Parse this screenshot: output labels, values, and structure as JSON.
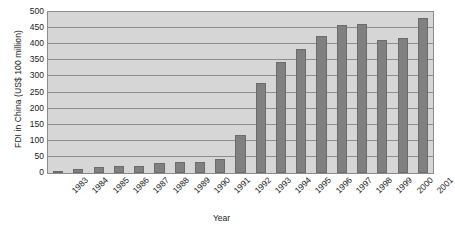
{
  "chart_data": {
    "type": "bar",
    "title": "",
    "xlabel": "Year",
    "ylabel": "FDI in China (US$ 100 million)",
    "categories": [
      "1983",
      "1984",
      "1985",
      "1986",
      "1987",
      "1988",
      "1989",
      "1990",
      "1991",
      "1992",
      "1993",
      "1994",
      "1995",
      "1996",
      "1997",
      "1998",
      "1999",
      "2000",
      "2001"
    ],
    "values": [
      6,
      13,
      19,
      22,
      23,
      32,
      33,
      35,
      44,
      117,
      280,
      345,
      385,
      425,
      460,
      462,
      414,
      419,
      482
    ],
    "series": [
      {
        "name": "FDI in China",
        "values": [
          6,
          13,
          19,
          22,
          23,
          32,
          33,
          35,
          44,
          117,
          280,
          345,
          385,
          425,
          460,
          462,
          414,
          419,
          482
        ]
      }
    ],
    "ylim": [
      0,
      500
    ],
    "y_ticks": [
      0,
      50,
      100,
      150,
      200,
      250,
      300,
      350,
      400,
      450,
      500
    ],
    "y_tick_labels": [
      "0",
      "50",
      "100",
      "150",
      "200",
      "250",
      "300",
      "350",
      "400",
      "450",
      "500"
    ],
    "grid": true,
    "grid_axis": "y",
    "legend": false,
    "legend_position": "none",
    "colors": {
      "bar_fill": "#808080",
      "bar_border": "#6b6b6b",
      "plot_background": "#d6d6d6",
      "axis_line": "#8c8c8c",
      "gridline": "#8c8c8c",
      "text": "#1a1a1a",
      "figure_background": "#ffffff"
    }
  }
}
